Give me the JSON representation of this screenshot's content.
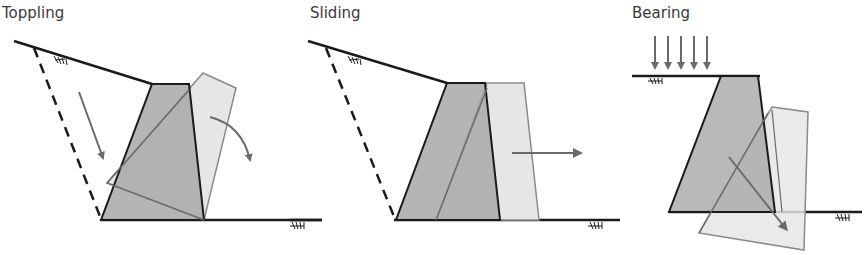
{
  "figure": {
    "colors": {
      "wall_fill": "#a8a8a8",
      "displaced_fill": "#e6e6e6",
      "outline": "#1a1a1a",
      "displaced_outline": "#8a8a8a",
      "arrow": "#6a6a6a"
    },
    "panels": [
      {
        "title": "Toppling",
        "motion": "rotation about toe"
      },
      {
        "title": "Sliding",
        "motion": "horizontal translation"
      },
      {
        "title": "Bearing",
        "motion": "settlement / rotation into foundation",
        "load": "surcharge arrows (5)"
      }
    ]
  }
}
